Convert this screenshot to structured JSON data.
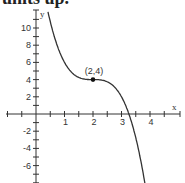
{
  "header": {
    "text": "units up."
  },
  "chart_data": {
    "type": "line",
    "title": "",
    "xlabel": "x",
    "ylabel": "y",
    "xlim": [
      -1,
      4.7
    ],
    "ylim": [
      -8,
      11.5
    ],
    "x_ticks": [
      1,
      2,
      3,
      4
    ],
    "x_tick_labels": [
      "1",
      "2",
      "3",
      "4"
    ],
    "y_ticks": [
      -6,
      -4,
      -2,
      2,
      4,
      6,
      8,
      10
    ],
    "y_tick_labels": [
      "-6",
      "-4",
      "-2",
      "2",
      "4",
      "6",
      "8",
      "10"
    ],
    "minor_x_step": 0.5,
    "minor_y_step": 1,
    "grid": false,
    "series": [
      {
        "name": "f(x) = -2(x-2)^3 + 4",
        "points": [
          [
            0.5,
            10.75
          ],
          [
            1,
            6
          ],
          [
            1.5,
            4.25
          ],
          [
            2,
            4
          ],
          [
            2.5,
            3.75
          ],
          [
            3,
            2
          ],
          [
            3.26,
            0
          ],
          [
            3.5,
            -2.75
          ],
          [
            3.75,
            -6.72
          ],
          [
            3.85,
            -8.7
          ]
        ]
      }
    ],
    "annotations": [
      {
        "label": "(2,4)",
        "x": 2,
        "y": 4,
        "marker": "filled-circle"
      }
    ]
  }
}
